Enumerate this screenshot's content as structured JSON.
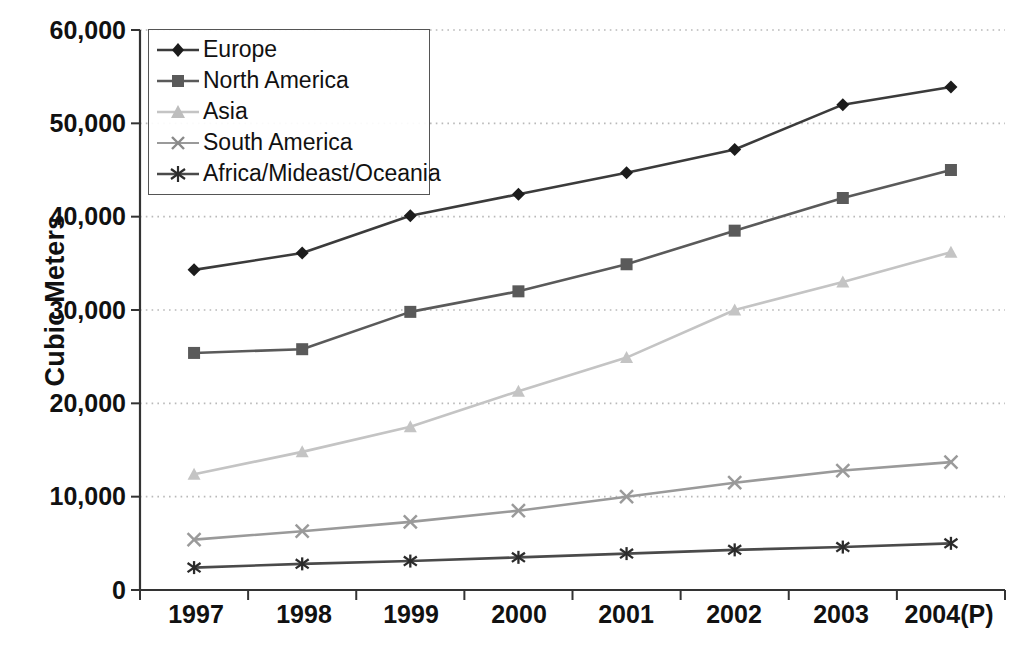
{
  "chart_data": {
    "type": "line",
    "title": "",
    "xlabel": "",
    "ylabel": "Cubic Meters",
    "categories": [
      "1997",
      "1998",
      "1999",
      "2000",
      "2001",
      "2002",
      "2003",
      "2004(P)"
    ],
    "ylim": [
      0,
      60000
    ],
    "ytick_labels": [
      "60,000",
      "50,000",
      "40,000",
      "30,000",
      "20,000",
      "10,000",
      "0"
    ],
    "ytick_values": [
      60000,
      50000,
      40000,
      30000,
      20000,
      10000,
      0
    ],
    "grid": "horizontal-dotted",
    "legend_position": "top-left-inside",
    "series": [
      {
        "name": "Europe",
        "marker": "diamond",
        "color": "#3b3b3b",
        "values": [
          34300,
          36100,
          40100,
          42400,
          44700,
          47200,
          52000,
          53900
        ]
      },
      {
        "name": "North America",
        "marker": "square",
        "color": "#5a5a5a",
        "values": [
          25400,
          25800,
          29800,
          32000,
          34900,
          38500,
          42000,
          45000
        ]
      },
      {
        "name": "Asia",
        "marker": "triangle",
        "color": "#c4c4c4",
        "values": [
          12400,
          14800,
          17500,
          21300,
          24900,
          30000,
          33000,
          36200
        ]
      },
      {
        "name": "South America",
        "marker": "x-cross",
        "color": "#9a9a9a",
        "values": [
          5400,
          6300,
          7300,
          8500,
          10000,
          11500,
          12800,
          13700
        ]
      },
      {
        "name": "Africa/Mideast/Oceania",
        "marker": "asterisk",
        "color": "#4a4a4a",
        "values": [
          2400,
          2800,
          3100,
          3500,
          3900,
          4300,
          4600,
          5000
        ]
      }
    ]
  },
  "axes": {
    "y_title": "Cubic Meters",
    "y_ticks": [
      "60,000",
      "50,000",
      "40,000",
      "30,000",
      "20,000",
      "10,000",
      "0"
    ],
    "x_ticks": [
      "1997",
      "1998",
      "1999",
      "2000",
      "2001",
      "2002",
      "2003",
      "2004(P)"
    ]
  },
  "legend": {
    "items": [
      {
        "label": "Europe",
        "marker": "diamond-marker",
        "color": "#3b3b3b"
      },
      {
        "label": "North America",
        "marker": "square-marker",
        "color": "#5a5a5a"
      },
      {
        "label": "Asia",
        "marker": "triangle-marker",
        "color": "#c4c4c4"
      },
      {
        "label": "South America",
        "marker": "x-cross-marker",
        "color": "#9a9a9a"
      },
      {
        "label": "Africa/Mideast/Oceania",
        "marker": "asterisk-marker",
        "color": "#4a4a4a"
      }
    ]
  }
}
